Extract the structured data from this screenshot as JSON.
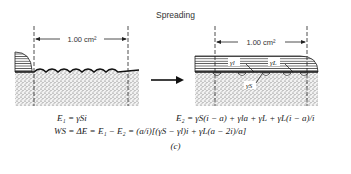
{
  "title": "Spreading",
  "left_panel": {
    "dimension_label": "1.00 cm²"
  },
  "right_panel": {
    "dimension_label": "1.00 cm²",
    "labels": [
      "γl",
      "γL",
      "γS"
    ]
  },
  "equations": {
    "e1": "E₁ = γSi",
    "e2": "E₂ = γS(i − a) + γla + γL + γL(i − a)/i",
    "ws": "WS = ΔE = E₁ − E₂ = (a/i)[(γS − γl)i + γL(a − 2i)/a]"
  },
  "caption": "(c)"
}
